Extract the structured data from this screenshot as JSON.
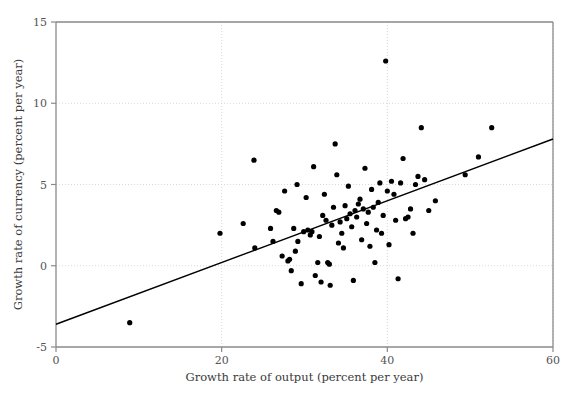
{
  "chart_data": {
    "type": "scatter",
    "title": "",
    "xlabel": "Growth rate of output (percent per year)",
    "ylabel": "Growth rate of currency (percent per year)",
    "xlim": [
      0,
      60
    ],
    "ylim": [
      -5,
      15
    ],
    "xticks": [
      0,
      20,
      40,
      60
    ],
    "yticks": [
      -5,
      0,
      5,
      10,
      15
    ],
    "xtick_labels": [
      "0",
      "20",
      "40",
      "60"
    ],
    "ytick_labels": [
      "-5",
      "0",
      "5",
      "10",
      "15"
    ],
    "grid": true,
    "grid_style": "dotted",
    "grid_color": "#d8d8d8",
    "axis_color": "#8a8a8a",
    "legend": "none",
    "point_color": "#000000",
    "point_size": 2.6,
    "series": [
      {
        "name": "countries",
        "marker": "circle",
        "points": [
          [
            8.9,
            -3.5
          ],
          [
            19.8,
            2.0
          ],
          [
            22.6,
            2.6
          ],
          [
            23.9,
            6.5
          ],
          [
            24.0,
            1.1
          ],
          [
            25.9,
            2.3
          ],
          [
            26.2,
            1.5
          ],
          [
            26.6,
            3.4
          ],
          [
            26.9,
            3.3
          ],
          [
            27.3,
            0.6
          ],
          [
            27.6,
            4.6
          ],
          [
            28.0,
            0.3
          ],
          [
            28.2,
            0.4
          ],
          [
            28.4,
            -0.3
          ],
          [
            28.7,
            2.3
          ],
          [
            28.9,
            0.9
          ],
          [
            29.1,
            5.0
          ],
          [
            29.2,
            1.5
          ],
          [
            29.6,
            -1.1
          ],
          [
            29.9,
            2.1
          ],
          [
            30.2,
            4.2
          ],
          [
            30.4,
            2.2
          ],
          [
            30.7,
            1.9
          ],
          [
            30.9,
            2.1
          ],
          [
            31.1,
            6.1
          ],
          [
            31.3,
            -0.6
          ],
          [
            31.6,
            0.2
          ],
          [
            31.8,
            1.8
          ],
          [
            32.0,
            -1.0
          ],
          [
            32.2,
            3.1
          ],
          [
            32.4,
            4.4
          ],
          [
            32.6,
            2.8
          ],
          [
            32.8,
            0.2
          ],
          [
            33.0,
            0.1
          ],
          [
            33.1,
            -1.2
          ],
          [
            33.3,
            2.5
          ],
          [
            33.5,
            3.6
          ],
          [
            33.7,
            7.5
          ],
          [
            33.9,
            5.6
          ],
          [
            34.1,
            1.4
          ],
          [
            34.3,
            2.7
          ],
          [
            34.5,
            2.0
          ],
          [
            34.7,
            1.1
          ],
          [
            34.9,
            3.7
          ],
          [
            35.1,
            2.9
          ],
          [
            35.3,
            4.9
          ],
          [
            35.5,
            3.2
          ],
          [
            35.7,
            2.4
          ],
          [
            35.9,
            -0.9
          ],
          [
            36.1,
            3.4
          ],
          [
            36.3,
            3.0
          ],
          [
            36.5,
            3.8
          ],
          [
            36.7,
            4.1
          ],
          [
            36.9,
            1.6
          ],
          [
            37.1,
            3.5
          ],
          [
            37.3,
            6.0
          ],
          [
            37.5,
            2.6
          ],
          [
            37.7,
            3.3
          ],
          [
            37.9,
            1.2
          ],
          [
            38.1,
            4.7
          ],
          [
            38.3,
            3.6
          ],
          [
            38.5,
            0.2
          ],
          [
            38.7,
            2.2
          ],
          [
            38.9,
            3.9
          ],
          [
            39.1,
            5.1
          ],
          [
            39.3,
            2.0
          ],
          [
            39.5,
            3.1
          ],
          [
            39.8,
            12.6
          ],
          [
            40.0,
            4.6
          ],
          [
            40.2,
            1.3
          ],
          [
            40.5,
            5.2
          ],
          [
            40.8,
            4.4
          ],
          [
            41.0,
            2.8
          ],
          [
            41.3,
            -0.8
          ],
          [
            41.6,
            5.1
          ],
          [
            41.9,
            6.6
          ],
          [
            42.2,
            2.9
          ],
          [
            42.5,
            3.0
          ],
          [
            42.8,
            3.5
          ],
          [
            43.1,
            2.0
          ],
          [
            43.4,
            5.0
          ],
          [
            43.7,
            5.5
          ],
          [
            44.1,
            8.5
          ],
          [
            44.5,
            5.3
          ],
          [
            45.0,
            3.4
          ],
          [
            45.8,
            4.0
          ],
          [
            49.4,
            5.6
          ],
          [
            51.0,
            6.7
          ],
          [
            52.6,
            8.5
          ]
        ]
      }
    ],
    "trendline": {
      "name": "regression-line",
      "x0": 0,
      "y0": -3.6,
      "x1": 60,
      "y1": 7.8,
      "color": "#000000",
      "width": 1.4
    }
  }
}
